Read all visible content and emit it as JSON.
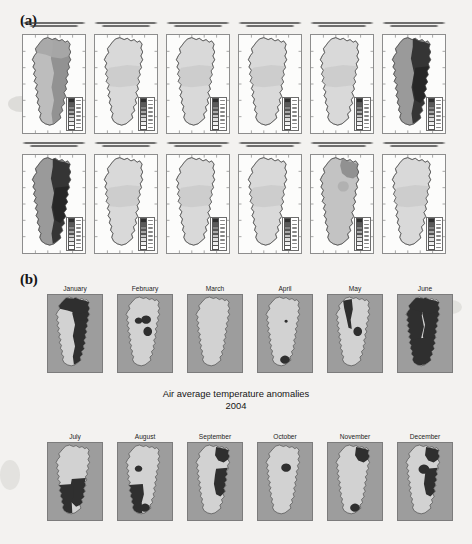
{
  "figure": {
    "panel_a_label": "(a)",
    "panel_b_label": "(b)",
    "caption_line1": "Air average temperature anomalies",
    "caption_line2": "2004"
  },
  "colors": {
    "page_background": "#f3f2f0",
    "map_frame": "#8d8d8d",
    "b_sea_background": "#9d9d9d",
    "b_light_class": "#d2d2d2",
    "b_dark_class": "#2f2f2f",
    "a_land_light": "#d8d8d8",
    "a_land_mid": "#b4b4b4",
    "a_land_dark": "#3a3a3a",
    "outline": "#3c3c3c",
    "text": "#151515"
  },
  "panel_a": {
    "description": "Twelve small monthly anomaly maps of mainland Portugal with two-line titles, graticule frames and legend boxes",
    "rows": [
      {
        "maps": [
          {
            "month": "January",
            "title_line1": "Anomalia da Temperatura Media do ar - Janeiro de 2004",
            "title_line2": "Diferenca em relacao ao normal 1961-1990",
            "shade": "dark"
          },
          {
            "month": "February",
            "title_line1": "Anomalia da Temperatura Media do ar - Fevereiro de 2004",
            "title_line2": "Diferenca em relacao ao normal 1961-1990",
            "shade": "light"
          },
          {
            "month": "March",
            "title_line1": "Anomalia da Temperatura Media do ar - Marco de 2004",
            "title_line2": "Diferenca em relacao ao normal 1961-1990",
            "shade": "light"
          },
          {
            "month": "April",
            "title_line1": "Anomalia da Temperatura Media do ar - Abril de 2004",
            "title_line2": "Diferenca em relacao ao normal 1961-1990",
            "shade": "light"
          },
          {
            "month": "May",
            "title_line1": "Anomalia da Temperatura Media do ar - Maio de 2004",
            "title_line2": "Diferenca em relacao ao normal 1961-1990",
            "shade": "light"
          },
          {
            "month": "June",
            "title_line1": "Anomalia da Temperatura Media do ar - Junho de 2004",
            "title_line2": "Diferenca em relacao ao normal 1961-1990",
            "shade": "verydark"
          }
        ]
      },
      {
        "maps": [
          {
            "month": "July",
            "title_line1": "Anomalia da Temperatura Media do ar - Julho de 2004",
            "title_line2": "Diferenca em relacao ao normal 1961-1990",
            "shade": "verydark"
          },
          {
            "month": "August",
            "title_line1": "Anomalia da Temperatura Media do ar - Agosto de 2004",
            "title_line2": "Diferenca em relacao ao normal 1961-1990",
            "shade": "light"
          },
          {
            "month": "September",
            "title_line1": "Anomalia da Temperatura Media do ar - Setembro de 2004",
            "title_line2": "Diferenca em relacao ao normal 1961-1990",
            "shade": "light"
          },
          {
            "month": "October",
            "title_line1": "Anomalia da Temperatura Media do ar - Outubro de 2004",
            "title_line2": "Diferenca em relacao ao normal 1961-1990",
            "shade": "light"
          },
          {
            "month": "November",
            "title_line1": "Anomalia da Temperatura Media do ar - Novembro de 2004",
            "title_line2": "Diferenca em relacao ao normal 1961-1990",
            "shade": "mid"
          },
          {
            "month": "December",
            "title_line1": "Anomalia da Temperatura Media do ar - Dezembro de 2004",
            "title_line2": "Diferenca em relacao ao normal 1961-1990",
            "shade": "light"
          }
        ]
      }
    ]
  },
  "panel_b": {
    "row1": [
      "January",
      "February",
      "March",
      "April",
      "May",
      "June"
    ],
    "row2": [
      "July",
      "August",
      "September",
      "October",
      "November",
      "December"
    ]
  },
  "chart_data": {
    "type": "map",
    "title": "Air average temperature anomalies",
    "subtitle": "2004",
    "region": "Mainland Portugal",
    "panels": [
      {
        "id": "a",
        "label": "(a)",
        "n_maps": 12,
        "layout": "2 rows x 6 columns",
        "has_legend": true,
        "has_graticule": true
      },
      {
        "id": "b",
        "label": "(b)",
        "n_maps": 12,
        "layout": "2 rows x 6 columns",
        "has_legend": false,
        "classes": [
          "light",
          "dark"
        ]
      }
    ],
    "months": [
      "January",
      "February",
      "March",
      "April",
      "May",
      "June",
      "July",
      "August",
      "September",
      "October",
      "November",
      "December"
    ],
    "panel_b_dark_coverage_fraction": [
      0.8,
      0.08,
      0.0,
      0.05,
      0.22,
      0.85,
      0.45,
      0.18,
      0.4,
      0.03,
      0.3,
      0.38
    ],
    "legend_note": "Legend text in panel (a) is not legible at source resolution"
  }
}
